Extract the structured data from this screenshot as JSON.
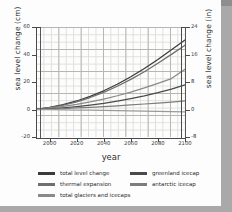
{
  "chart_data": {
    "type": "line",
    "title": "",
    "xlabel": "year",
    "ylabel": "sea level change (cm)",
    "ylabel_secondary": "sea level change (in)",
    "xlim": [
      1990,
      2100
    ],
    "ylim": [
      -20,
      60
    ],
    "ylim_secondary": [
      -8,
      24
    ],
    "grid": true,
    "legend_position": "below",
    "xticks": [
      "2000",
      "2020",
      "2040",
      "2060",
      "2080",
      "2100"
    ],
    "xtick_values": [
      2000,
      2020,
      2040,
      2060,
      2080,
      2100
    ],
    "yticks": [
      "60",
      "40",
      "20",
      "0",
      "-20"
    ],
    "ytick_values": [
      60,
      40,
      20,
      0,
      -20
    ],
    "yticks_secondary": [
      "24",
      "16",
      "8",
      "0",
      "-8"
    ],
    "ytick_secondary_values": [
      24,
      16,
      8,
      0,
      -8
    ],
    "x": [
      1990,
      2000,
      2010,
      2020,
      2030,
      2040,
      2050,
      2060,
      2070,
      2080,
      2090,
      2100
    ],
    "series": [
      {
        "name": "total level change",
        "color": "#3a3a3a",
        "values": [
          0,
          1.5,
          3.5,
          6.2,
          9.6,
          13.6,
          18.4,
          23.8,
          29.8,
          36.4,
          43.4,
          50.5
        ]
      },
      {
        "name": "thermal expansion",
        "color": "#6f6f6f",
        "values": [
          0,
          1.3,
          3.1,
          5.6,
          8.7,
          12.5,
          16.9,
          21.9,
          27.5,
          33.6,
          40.1,
          46.8
        ]
      },
      {
        "name": "total glaciers and icecaps",
        "color": "#8a8a8a",
        "values": [
          0,
          1.0,
          2.2,
          3.7,
          5.5,
          7.6,
          10.0,
          12.7,
          15.7,
          19.0,
          22.5,
          29.2
        ]
      },
      {
        "name": "greenland icecap",
        "color": "#4a4a4a",
        "values": [
          0,
          0.5,
          1.2,
          2.1,
          3.2,
          4.5,
          6.1,
          7.9,
          9.9,
          12.2,
          14.8,
          18.0
        ]
      },
      {
        "name": "antarctic icecap",
        "color": "#7d7d7d",
        "values": [
          0,
          0.3,
          0.7,
          1.1,
          1.6,
          2.1,
          2.7,
          3.3,
          4.0,
          4.7,
          5.4,
          6.2
        ]
      },
      {
        "name": "antarctic icecap (lower)",
        "color": "#9a9a9a",
        "values": [
          0,
          -0.1,
          -0.2,
          -0.4,
          -0.5,
          -0.7,
          -0.9,
          -1.0,
          -1.2,
          -1.4,
          -1.5,
          -1.7
        ]
      }
    ]
  },
  "legend": {
    "rows": [
      [
        {
          "label": "total level change",
          "color": "#3a3a3a"
        },
        {
          "label": "greenland icecap",
          "color": "#4a4a4a"
        }
      ],
      [
        {
          "label": "thermal expansion",
          "color": "#6f6f6f"
        },
        {
          "label": "antarctic icecap",
          "color": "#7d7d7d"
        }
      ],
      [
        {
          "label": "total glaciers and icecaps",
          "color": "#8a8a8a"
        }
      ]
    ]
  }
}
